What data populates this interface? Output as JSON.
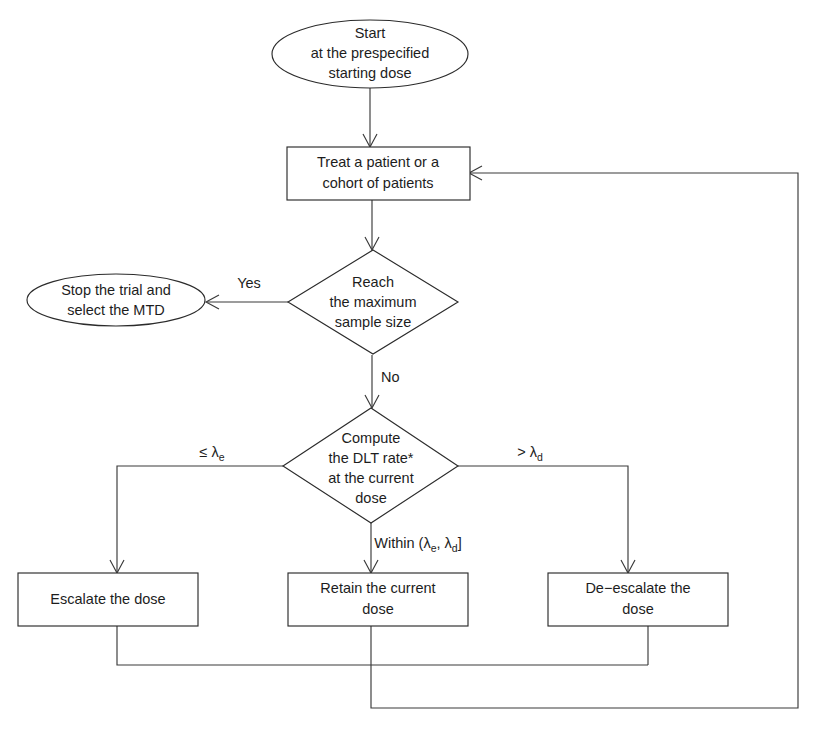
{
  "diagram": {
    "type": "flowchart",
    "colors": {
      "background": "#ffffff",
      "stroke": "#2b2b2b",
      "connector": "#3a3a3a",
      "text": "#1d1d1d"
    }
  },
  "nodes": {
    "start": {
      "shape": "ellipse",
      "lines": [
        "Start",
        "at the prespecified",
        "starting dose"
      ]
    },
    "treat": {
      "shape": "rectangle",
      "lines": [
        "Treat a patient or a",
        "cohort of patients"
      ]
    },
    "reach_max": {
      "shape": "diamond",
      "lines": [
        "Reach",
        "the maximum",
        "sample size"
      ]
    },
    "stop_trial": {
      "shape": "ellipse",
      "lines": [
        "Stop the trial and",
        "select the MTD"
      ]
    },
    "compute_dlt": {
      "shape": "diamond",
      "lines": [
        "Compute",
        "the DLT rate*",
        "at the current",
        "dose"
      ]
    },
    "escalate": {
      "shape": "rectangle",
      "lines": [
        "Escalate the dose"
      ]
    },
    "retain": {
      "shape": "rectangle",
      "lines": [
        "Retain the current",
        "dose"
      ]
    },
    "deescalate": {
      "shape": "rectangle",
      "lines": [
        "De−escalate the",
        "dose"
      ]
    }
  },
  "edge_labels": {
    "yes": "Yes",
    "no": "No",
    "lambda_e_branch": {
      "prefix": "≤ λ",
      "subscript": "e"
    },
    "lambda_d_branch": {
      "prefix": "> λ",
      "subscript": "d"
    },
    "within_branch": {
      "word": "Within  (λ",
      "sub1": "e",
      "mid": ", λ",
      "sub2": "d",
      "close": "]"
    }
  }
}
